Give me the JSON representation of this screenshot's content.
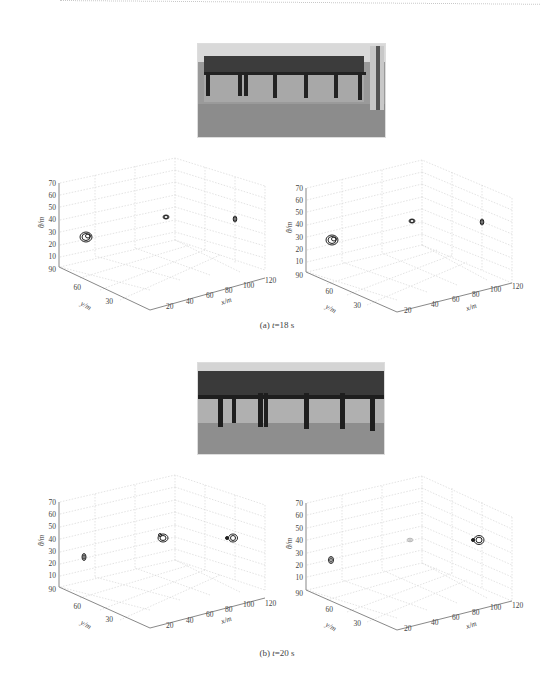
{
  "figure": {
    "panels": [
      {
        "id": "a",
        "caption_label": "(a)",
        "caption_var": "t",
        "caption_value": "=18 s",
        "photo_desc": "row of dark chairs against wall",
        "plots": [
          {
            "blobs": [
              {
                "x": 60,
                "y": 280,
                "size": 7
              },
              {
                "x": 166,
                "y": 217,
                "size": 4
              },
              {
                "x": 235,
                "y": 219,
                "size": 4
              }
            ]
          },
          {
            "blobs": [
              {
                "x": 332,
                "y": 240,
                "size": 7
              },
              {
                "x": 412,
                "y": 221,
                "size": 4
              },
              {
                "x": 482,
                "y": 222,
                "size": 4
              }
            ]
          }
        ]
      },
      {
        "id": "b",
        "caption_label": "(b)",
        "caption_var": "t",
        "caption_value": "=20 s",
        "photo_desc": "close-up of chair row, blurred",
        "plots": [
          {
            "blobs": [
              {
                "x": 84,
                "y": 557,
                "size": 4
              },
              {
                "x": 163,
                "y": 537,
                "size": 6
              },
              {
                "x": 232,
                "y": 537,
                "size": 6
              }
            ]
          },
          {
            "blobs": [
              {
                "x": 331,
                "y": 560,
                "size": 4
              },
              {
                "x": 410,
                "y": 540,
                "size": 3,
                "faint": true
              },
              {
                "x": 479,
                "y": 540,
                "size": 6
              }
            ]
          }
        ]
      }
    ],
    "axes": {
      "z_label": "θ/m",
      "z_ticks": [
        "70",
        "60",
        "50",
        "40",
        "30",
        "20",
        "10"
      ],
      "y_label": "y/m",
      "y_ticks": [
        "90",
        "60",
        "30"
      ],
      "x_label": "x/m",
      "x_ticks": [
        "20",
        "40",
        "60",
        "80",
        "100",
        "120"
      ]
    }
  }
}
